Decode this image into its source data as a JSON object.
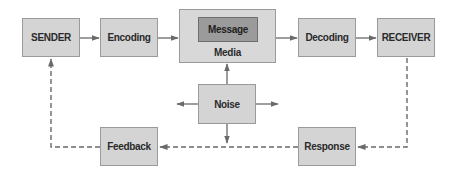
{
  "diagram": {
    "type": "communication-process-model",
    "colors": {
      "box_fill": "#d4d4d4",
      "box_border": "#9a9a9a",
      "message_fill": "#9b9b9b",
      "arrow": "#6a6a6a",
      "text": "#2a2a2a"
    },
    "nodes": {
      "sender": {
        "label": "SENDER"
      },
      "encoding": {
        "label": "Encoding"
      },
      "media": {
        "label": "Media"
      },
      "message": {
        "label": "Message"
      },
      "decoding": {
        "label": "Decoding"
      },
      "receiver": {
        "label": "RECEIVER"
      },
      "noise": {
        "label": "Noise"
      },
      "feedback": {
        "label": "Feedback"
      },
      "response": {
        "label": "Response"
      }
    },
    "edges": [
      {
        "from": "SENDER",
        "to": "Encoding",
        "style": "solid"
      },
      {
        "from": "Encoding",
        "to": "Media",
        "style": "solid"
      },
      {
        "from": "Media",
        "to": "Decoding",
        "style": "solid"
      },
      {
        "from": "Decoding",
        "to": "RECEIVER",
        "style": "solid"
      },
      {
        "from": "Noise",
        "to": "Media",
        "style": "solid"
      },
      {
        "from": "Noise",
        "to": "left",
        "style": "solid"
      },
      {
        "from": "Noise",
        "to": "right",
        "style": "solid"
      },
      {
        "from": "Noise",
        "to": "down",
        "style": "solid"
      },
      {
        "from": "RECEIVER",
        "to": "Response",
        "style": "dashed"
      },
      {
        "from": "Response",
        "to": "Feedback",
        "style": "dashed"
      },
      {
        "from": "Feedback",
        "to": "SENDER",
        "style": "dashed"
      }
    ]
  }
}
